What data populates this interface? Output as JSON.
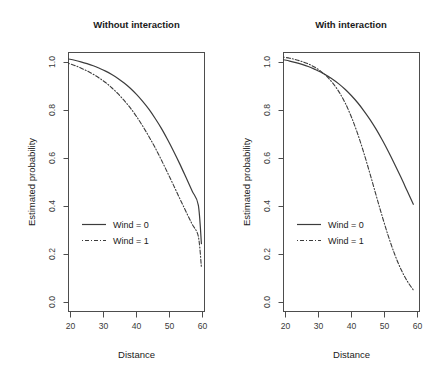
{
  "figure": {
    "width": 442,
    "height": 380,
    "background": "#ffffff",
    "line_color": "#3c3c3c",
    "axis_color": "#4d4d4d"
  },
  "chart_data": [
    {
      "type": "line",
      "title": "Without interaction",
      "xlabel": "Distance",
      "ylabel": "Estimated probability",
      "xlim": [
        18,
        62
      ],
      "ylim": [
        0.0,
        1.0
      ],
      "xticks": [
        20,
        30,
        40,
        50,
        60
      ],
      "xticklabels": [
        "20",
        "30",
        "40",
        "50",
        "60"
      ],
      "yticks": [
        0.0,
        0.2,
        0.4,
        0.6,
        0.8,
        1.0
      ],
      "yticklabels": [
        "0.0",
        "0.2",
        "0.4",
        "0.6",
        "0.8",
        "1.0"
      ],
      "grid": false,
      "legend_position": "center-left",
      "series": [
        {
          "name": "Wind = 0",
          "style": "solid",
          "x": [
            18,
            20,
            22,
            24,
            26,
            28,
            30,
            32,
            34,
            36,
            38,
            40,
            42,
            44,
            46,
            48,
            50,
            52,
            54,
            56,
            58,
            60,
            61
          ],
          "values": [
            0.975,
            0.97,
            0.964,
            0.957,
            0.949,
            0.939,
            0.928,
            0.915,
            0.9,
            0.882,
            0.862,
            0.838,
            0.811,
            0.781,
            0.746,
            0.708,
            0.665,
            0.619,
            0.57,
            0.518,
            0.465,
            0.411,
            0.262
          ]
        },
        {
          "name": "Wind = 1",
          "style": "dashed",
          "x": [
            18,
            20,
            22,
            24,
            26,
            28,
            30,
            32,
            34,
            36,
            38,
            40,
            42,
            44,
            46,
            48,
            50,
            52,
            54,
            56,
            58,
            60,
            61
          ],
          "values": [
            0.958,
            0.95,
            0.94,
            0.929,
            0.916,
            0.901,
            0.884,
            0.864,
            0.841,
            0.815,
            0.786,
            0.753,
            0.716,
            0.676,
            0.633,
            0.586,
            0.537,
            0.487,
            0.436,
            0.386,
            0.337,
            0.29,
            0.171
          ]
        }
      ]
    },
    {
      "type": "line",
      "title": "With interaction",
      "xlabel": "Distance",
      "ylabel": "Estimated probability",
      "xlim": [
        18,
        62
      ],
      "ylim": [
        0.0,
        1.0
      ],
      "xticks": [
        20,
        30,
        40,
        50,
        60
      ],
      "xticklabels": [
        "20",
        "30",
        "40",
        "50",
        "60"
      ],
      "yticks": [
        0.0,
        0.2,
        0.4,
        0.6,
        0.8,
        1.0
      ],
      "yticklabels": [
        "0.0",
        "0.2",
        "0.4",
        "0.6",
        "0.8",
        "1.0"
      ],
      "grid": false,
      "legend_position": "center-left",
      "crossing_point": {
        "x": 30,
        "y": 0.92
      },
      "series": [
        {
          "name": "Wind = 0",
          "style": "solid",
          "x": [
            18,
            20,
            22,
            24,
            26,
            28,
            30,
            32,
            34,
            36,
            38,
            40,
            42,
            44,
            46,
            48,
            50,
            52,
            54,
            56,
            58,
            60
          ],
          "values": [
            0.972,
            0.967,
            0.961,
            0.954,
            0.946,
            0.936,
            0.925,
            0.911,
            0.896,
            0.878,
            0.857,
            0.833,
            0.806,
            0.775,
            0.741,
            0.703,
            0.661,
            0.616,
            0.568,
            0.518,
            0.466,
            0.414
          ]
        },
        {
          "name": "Wind = 1",
          "style": "dashed",
          "x": [
            18,
            20,
            22,
            24,
            26,
            28,
            30,
            32,
            34,
            36,
            38,
            40,
            42,
            44,
            46,
            48,
            50,
            52,
            54,
            56,
            58,
            60
          ],
          "values": [
            0.982,
            0.978,
            0.972,
            0.965,
            0.956,
            0.944,
            0.928,
            0.908,
            0.881,
            0.847,
            0.804,
            0.75,
            0.686,
            0.612,
            0.531,
            0.447,
            0.365,
            0.288,
            0.22,
            0.163,
            0.118,
            0.083
          ]
        }
      ]
    }
  ],
  "legend": {
    "entries": [
      {
        "label": "Wind = 0",
        "style": "solid"
      },
      {
        "label": "Wind = 1",
        "style": "dashed"
      }
    ]
  }
}
